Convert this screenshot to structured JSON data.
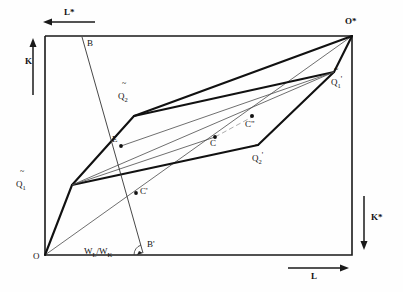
{
  "figure": {
    "type": "economics-diagram",
    "name": "Edgeworth production box diagram",
    "box": {
      "x0": 45,
      "y0": 36,
      "x1": 352,
      "y1": 255
    },
    "axis_labels": {
      "k_up": "K",
      "l_star": "L*",
      "k_star": "K*",
      "l_right": "L",
      "origin_lower_left": "O",
      "origin_upper_right": "O*"
    },
    "point_labels": {
      "q1_tilde": {
        "base": "Q",
        "sub": "1",
        "prime": "",
        "tilde": "~"
      },
      "q2_tilde": {
        "base": "Q",
        "sub": "2",
        "prime": "",
        "tilde": "~"
      },
      "q1_tilde_prime": {
        "base": "Q",
        "sub": "1",
        "prime": "'",
        "tilde": "~"
      },
      "q2_tilde_prime": {
        "base": "Q",
        "sub": "2",
        "prime": "'",
        "tilde": "~"
      },
      "b": "B",
      "b_prime": "B'",
      "e": "E",
      "c": "C",
      "c_prime": "C'",
      "c_double_prime": "C\""
    },
    "wage_rental_ratio": {
      "numerator": "W",
      "numerator_sub": "L",
      "slash": "/",
      "denominator": "W",
      "denominator_sub": "K"
    },
    "vertices": {
      "O": [
        45,
        255
      ],
      "O_star": [
        352,
        36
      ],
      "Q1_tilde": [
        72,
        185
      ],
      "Q2_tilde": [
        134,
        116
      ],
      "Q1_tilde_prime": [
        334,
        72
      ],
      "Q2_tilde_prime": [
        258,
        145
      ],
      "E": [
        121,
        145
      ],
      "C": [
        215,
        137
      ],
      "C_prime": [
        136,
        193
      ],
      "C_double_prime": [
        252,
        116
      ],
      "B": [
        82,
        37
      ],
      "B_prime": [
        143,
        253
      ]
    },
    "colors": {
      "ink": "#111111",
      "thin": "#555555",
      "background": "#ffffff"
    }
  }
}
